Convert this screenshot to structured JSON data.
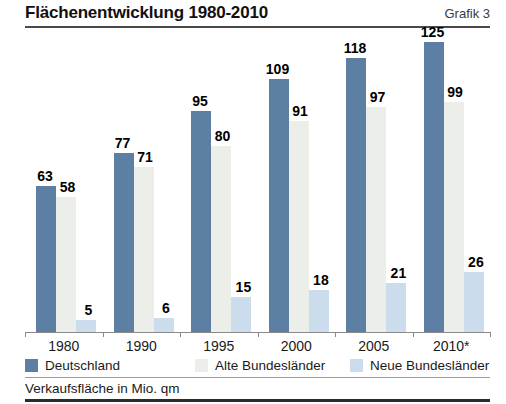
{
  "header": {
    "title": "Flächenentwicklung 1980-2010",
    "grafik_label": "Grafik 3"
  },
  "footnote": "Verkaufsfläche in Mio. qm",
  "legend": {
    "items": [
      {
        "label": "Deutschland",
        "color": "#5d7fa4"
      },
      {
        "label": "Alte Bundesländer",
        "color": "#eceee9"
      },
      {
        "label": "Neue Bundesländer",
        "color": "#cbdded"
      }
    ]
  },
  "chart_data": {
    "type": "bar",
    "title": "Flächenentwicklung 1980-2010",
    "xlabel": "",
    "ylabel": "Verkaufsfläche in Mio. qm",
    "ylim": [
      0,
      130
    ],
    "grid": false,
    "legend_position": "bottom",
    "categories": [
      "1980",
      "1990",
      "1995",
      "2000",
      "2005",
      "2010*"
    ],
    "series": [
      {
        "name": "Deutschland",
        "color": "#5d7fa4",
        "values": [
          63,
          77,
          95,
          109,
          118,
          125
        ]
      },
      {
        "name": "Alte Bundesländer",
        "color": "#eceee9",
        "values": [
          58,
          71,
          80,
          91,
          97,
          99
        ]
      },
      {
        "name": "Neue Bundesländer",
        "color": "#cbdded",
        "values": [
          5,
          6,
          15,
          18,
          21,
          26
        ]
      }
    ]
  }
}
